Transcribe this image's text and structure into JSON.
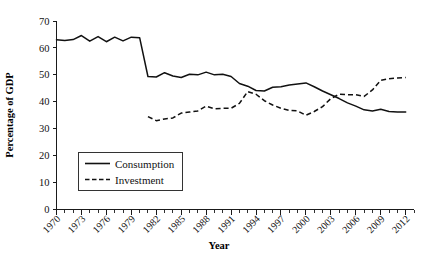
{
  "chart_data": {
    "type": "line",
    "title": "",
    "xlabel": "Year",
    "ylabel": "Percentage of GDP",
    "xlim": [
      1970,
      2013
    ],
    "ylim": [
      0,
      70
    ],
    "ytick_values": [
      0,
      10,
      20,
      30,
      40,
      50,
      60,
      70
    ],
    "ytick_labels": [
      "0",
      "10",
      "20",
      "30",
      "40",
      "50",
      "60",
      "70"
    ],
    "xtick_labels": [
      "1970",
      "1973",
      "1976",
      "1979",
      "1982",
      "1985",
      "1988",
      "1991",
      "1994",
      "1997",
      "2000",
      "2003",
      "2006",
      "2009",
      "2012"
    ],
    "xtick_values": [
      1970,
      1973,
      1976,
      1979,
      1982,
      1985,
      1988,
      1991,
      1994,
      1997,
      2000,
      2003,
      2006,
      2009,
      2012
    ],
    "xtick_minor_step": 1,
    "grid": false,
    "legend_position": "lower-left",
    "line_color": "#111111",
    "series": [
      {
        "name": "Consumption",
        "style": "solid",
        "x": [
          1970,
          1971,
          1972,
          1973,
          1974,
          1975,
          1976,
          1977,
          1978,
          1979,
          1980,
          1981,
          1982,
          1983,
          1984,
          1985,
          1986,
          1987,
          1988,
          1989,
          1990,
          1991,
          1992,
          1993,
          1994,
          1995,
          1996,
          1997,
          1998,
          1999,
          2000,
          2001,
          2002,
          2003,
          2004,
          2005,
          2006,
          2007,
          2008,
          2009,
          2010,
          2011,
          2012
        ],
        "values": [
          63.0,
          62.8,
          63.1,
          64.6,
          62.5,
          64.2,
          62.3,
          64.0,
          62.6,
          64.0,
          63.8,
          49.4,
          49.2,
          50.8,
          49.6,
          49.0,
          50.2,
          50.0,
          51.0,
          50.0,
          50.2,
          49.4,
          46.8,
          45.8,
          44.2,
          44.0,
          45.4,
          45.6,
          46.2,
          46.6,
          47.0,
          45.6,
          44.0,
          42.6,
          41.2,
          39.6,
          38.4,
          37.0,
          36.6,
          37.2,
          36.4,
          36.2,
          36.2
        ]
      },
      {
        "name": "Investment",
        "style": "dashed",
        "x": [
          1981,
          1982,
          1983,
          1984,
          1985,
          1986,
          1987,
          1988,
          1989,
          1990,
          1991,
          1992,
          1993,
          1994,
          1995,
          1996,
          1997,
          1998,
          1999,
          2000,
          2001,
          2002,
          2003,
          2004,
          2005,
          2006,
          2007,
          2008,
          2009,
          2010,
          2011,
          2012
        ],
        "values": [
          34.5,
          33.0,
          33.6,
          34.0,
          35.8,
          36.2,
          36.6,
          38.4,
          37.4,
          37.6,
          37.6,
          39.4,
          43.8,
          42.8,
          40.4,
          38.8,
          37.6,
          36.8,
          36.6,
          35.0,
          36.4,
          38.2,
          41.2,
          42.8,
          42.6,
          42.6,
          42.0,
          44.4,
          48.0,
          48.6,
          48.8,
          49.0
        ]
      }
    ]
  },
  "legend": {
    "items": [
      {
        "label": "Consumption",
        "style": "solid"
      },
      {
        "label": "Investment",
        "style": "dashed"
      }
    ]
  }
}
